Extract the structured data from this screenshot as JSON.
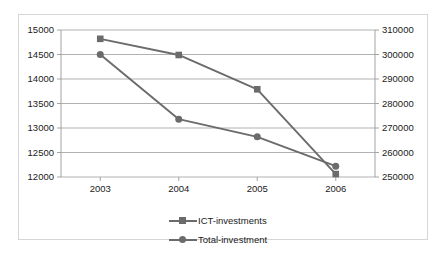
{
  "chart_data": {
    "type": "line",
    "title": "",
    "subtitle": "",
    "xlabel": "",
    "ylabel": "",
    "grid": true,
    "legend_position": "bottom",
    "categories": [
      "2003",
      "2004",
      "2005",
      "2006"
    ],
    "axes": {
      "left": {
        "label": "",
        "ylim": [
          12000,
          15000
        ],
        "step": 500,
        "ticks": [
          "12000",
          "12500",
          "13000",
          "13500",
          "14000",
          "14500",
          "15000"
        ],
        "tick_values": [
          12000,
          12500,
          13000,
          13500,
          14000,
          14500,
          15000
        ],
        "series": "ICT-investments"
      },
      "right": {
        "label": "",
        "ylim": [
          250000,
          310000
        ],
        "step": 10000,
        "ticks": [
          "250000",
          "260000",
          "270000",
          "280000",
          "290000",
          "300000",
          "310000"
        ],
        "tick_values": [
          250000,
          260000,
          270000,
          280000,
          290000,
          300000,
          310000
        ],
        "series": "Total-investment"
      }
    },
    "series": [
      {
        "name": "ICT-investments",
        "axis": "left",
        "marker": "square",
        "color": "#6b6b6b",
        "values": [
          14820,
          14490,
          13790,
          12060
        ]
      },
      {
        "name": "Total-investment",
        "axis": "right",
        "marker": "circle",
        "color": "#6b6b6b",
        "values": [
          300000,
          273600,
          266400,
          254400
        ]
      }
    ]
  },
  "legend": {
    "items": [
      {
        "label": "ICT-investments",
        "marker": "square"
      },
      {
        "label": "Total-investment",
        "marker": "circle"
      }
    ]
  },
  "colors": {
    "series": "#6b6b6b",
    "gridline": "#a8a8a8",
    "axis": "#9a9a9a",
    "frame": "#d6d6d6",
    "text": "#1a1a1a",
    "background": "#ffffff"
  }
}
